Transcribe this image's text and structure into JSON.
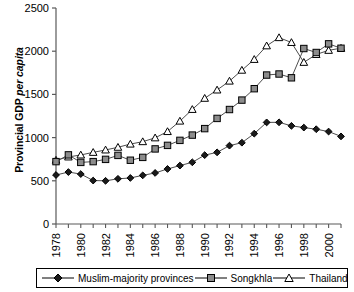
{
  "chart_data": {
    "type": "line",
    "title": "",
    "xlabel": "",
    "ylabel": "Provincial GDP per capita",
    "ylabel_plain": "Provincial GDP ",
    "ylabel_italic": "per capita",
    "xlim": [
      1978,
      2001
    ],
    "ylim": [
      0,
      2500
    ],
    "ytick_values": [
      0,
      500,
      1000,
      1500,
      2000,
      2500
    ],
    "ytick_labels": [
      "0",
      "500",
      "1000",
      "1500",
      "2000",
      "2500"
    ],
    "x": [
      1978,
      1979,
      1980,
      1981,
      1982,
      1983,
      1984,
      1985,
      1986,
      1987,
      1988,
      1989,
      1990,
      1991,
      1992,
      1993,
      1994,
      1995,
      1996,
      1997,
      1998,
      1999,
      2000,
      2001
    ],
    "xtick_labels": [
      "1978",
      "",
      "1980",
      "",
      "1982",
      "",
      "1984",
      "",
      "1986",
      "",
      "1988",
      "",
      "1990",
      "",
      "1992",
      "",
      "1994",
      "",
      "1996",
      "",
      "1998",
      "",
      "2000",
      ""
    ],
    "xtick_labels_shown": [
      "1978",
      "1980",
      "1982",
      "1984",
      "1986",
      "1988",
      "1990",
      "1992",
      "1994",
      "1996",
      "1998",
      "2000"
    ],
    "grid": false,
    "legend_position": "bottom",
    "series": [
      {
        "name": "Muslim-majority provinces",
        "marker": "filled-diamond",
        "color": "#000000",
        "fill": "#1a1a1a",
        "values": [
          567,
          601,
          578,
          503,
          500,
          523,
          533,
          563,
          591,
          637,
          676,
          714,
          797,
          829,
          907,
          941,
          1046,
          1176,
          1177,
          1136,
          1116,
          1097,
          1070,
          1014
        ]
      },
      {
        "name": "Songkhla",
        "marker": "filled-square",
        "color": "#000000",
        "fill": "#8c8c8c",
        "values": [
          722,
          800,
          713,
          722,
          748,
          794,
          738,
          771,
          869,
          910,
          968,
          1029,
          1104,
          1222,
          1325,
          1434,
          1566,
          1724,
          1736,
          1692,
          2031,
          1985,
          2085,
          2034
        ]
      },
      {
        "name": "Thailand",
        "marker": "open-triangle",
        "color": "#000000",
        "fill": "#ffffff",
        "values": [
          739,
          776,
          799,
          829,
          857,
          888,
          925,
          953,
          997,
          1070,
          1191,
          1326,
          1455,
          1551,
          1654,
          1780,
          1905,
          2062,
          2157,
          2101,
          1871,
          1962,
          2010,
          2035
        ]
      }
    ]
  },
  "legend": {
    "items": [
      {
        "label": "Muslim-majority provinces",
        "marker": "filled-diamond"
      },
      {
        "label": "Songkhla",
        "marker": "filled-square"
      },
      {
        "label": "Thailand",
        "marker": "open-triangle"
      }
    ]
  }
}
